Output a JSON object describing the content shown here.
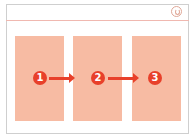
{
  "diagram": {
    "title_bar": {
      "icon": "power-icon"
    },
    "panels": [
      {
        "step": "1"
      },
      {
        "step": "2"
      },
      {
        "step": "3"
      }
    ],
    "arrows": [
      {
        "from": "1",
        "to": "2"
      },
      {
        "from": "2",
        "to": "3"
      }
    ],
    "colors": {
      "panel": "#f7bba3",
      "badge": "#e8402a",
      "arrow": "#e8402a",
      "frame": "#cfcfcf"
    }
  }
}
